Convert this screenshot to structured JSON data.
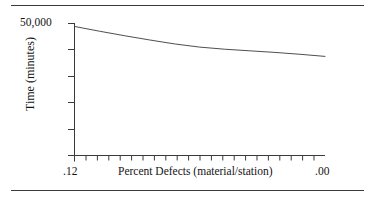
{
  "figure": {
    "background_color": "#ffffff",
    "line_color": "#3a3a3a",
    "text_color": "#141414"
  },
  "rules": {
    "top_label": "top-horizontal-rule",
    "bottom_label": "bottom-horizontal-rule"
  },
  "chart_data": {
    "type": "line",
    "title": "",
    "subtitle": "",
    "xlabel": "Percent Defects (material/station)",
    "ylabel": "Time (minutes)",
    "x_tick_labels": [
      ".12",
      ".00"
    ],
    "y_tick_labels": [
      "50,000"
    ],
    "xlim": [
      0.12,
      0.0
    ],
    "ylim": [
      0,
      50000
    ],
    "x_axis_reversed": true,
    "grid": false,
    "legend": false,
    "legend_position": "none",
    "x_minor_tick_count": 22,
    "y_tick_count": 6,
    "annotations": [],
    "series": [
      {
        "name": "Time vs Percent Defects",
        "x": [
          0.12,
          0.108,
          0.096,
          0.084,
          0.072,
          0.06,
          0.048,
          0.036,
          0.024,
          0.012,
          0.0
        ],
        "values": [
          48700,
          46900,
          45200,
          43600,
          42100,
          40900,
          40100,
          39500,
          38900,
          38200,
          37400
        ]
      }
    ]
  },
  "axis_titles": {
    "y": "Time (minutes)",
    "x": "Percent Defects (material/station)"
  },
  "tick_labels": {
    "y_top": "50,000",
    "x_left": ".12",
    "x_right": ".00"
  }
}
